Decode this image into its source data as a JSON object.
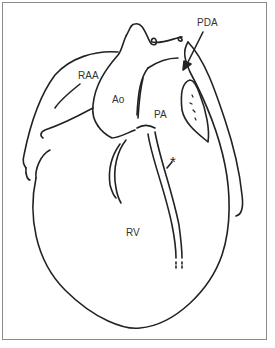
{
  "figure": {
    "type": "anatomical line drawing of the heart",
    "stroke_color": "#222222",
    "frame_color": "#8a8a8a",
    "labels": {
      "raa": "RAA",
      "ao": "Ao",
      "pa": "PA",
      "pda": "PDA",
      "rv": "RV",
      "asterisk": "*"
    }
  }
}
